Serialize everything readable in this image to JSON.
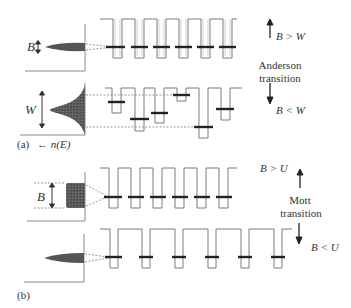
{
  "panel_a": {
    "caption": "(a)",
    "axis_label": "← n(E)",
    "upper": {
      "width_label": "B",
      "relation": "B > W"
    },
    "lower": {
      "width_label": "W",
      "relation": "B < W"
    },
    "transition": {
      "line1": "Anderson",
      "line2": "transition"
    }
  },
  "panel_b": {
    "caption": "(b)",
    "upper": {
      "width_label": "B",
      "relation": "B > U"
    },
    "lower": {
      "relation": "B < U"
    },
    "transition": {
      "line1": "Mott",
      "line2": "transition"
    }
  },
  "colors": {
    "line": "#7a7a7a",
    "level": "#222222",
    "fill": "#555555",
    "text": "#333333"
  }
}
